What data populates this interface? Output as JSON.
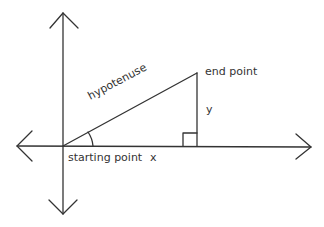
{
  "diagram": {
    "labels": {
      "hypotenuse": "hypotenuse",
      "end_point": "end point",
      "y": "y",
      "starting_point": "starting point",
      "x": "x"
    },
    "colors": {
      "line": "#333333",
      "background": "#ffffff"
    }
  }
}
